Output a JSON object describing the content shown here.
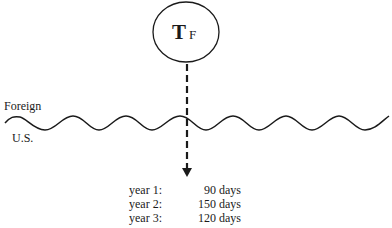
{
  "node": {
    "letter": "T",
    "subscript": "F"
  },
  "regions": {
    "top_label": "Foreign",
    "bottom_label": "U.S."
  },
  "schedule": [
    {
      "label": "year 1:",
      "value": "90 days"
    },
    {
      "label": "year 2:",
      "value": "150 days"
    },
    {
      "label": "year 3:",
      "value": "120 days"
    }
  ],
  "colors": {
    "stroke": "#1a1a1a",
    "background": "#ffffff"
  }
}
